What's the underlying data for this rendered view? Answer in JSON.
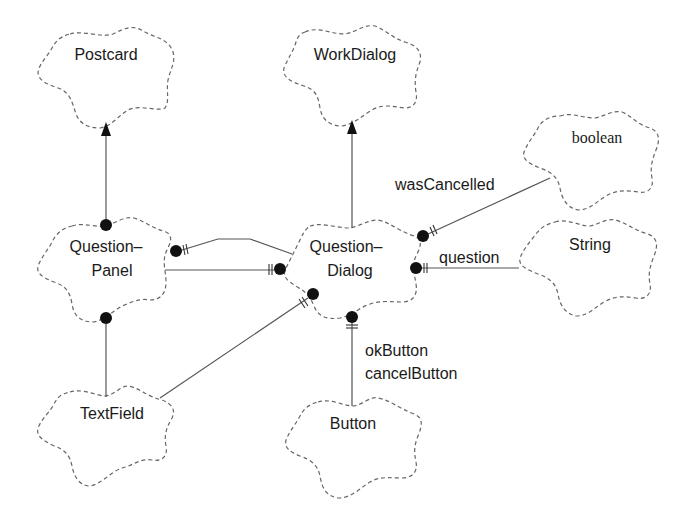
{
  "diagram": {
    "type": "class-diagram",
    "notation": "Booch-style cloud class diagram",
    "classes": [
      {
        "id": "postcard",
        "name": "Postcard",
        "lines": [
          "Postcard"
        ]
      },
      {
        "id": "workdialog",
        "name": "WorkDialog",
        "lines": [
          "WorkDialog"
        ]
      },
      {
        "id": "boolean",
        "name": "boolean",
        "lines": [
          "boolean"
        ]
      },
      {
        "id": "questionpanel",
        "name": "Question-Panel",
        "lines": [
          "Question–",
          "Panel"
        ]
      },
      {
        "id": "questiondialog",
        "name": "Question-Dialog",
        "lines": [
          "Question–",
          "Dialog"
        ]
      },
      {
        "id": "string",
        "name": "String",
        "lines": [
          "String"
        ]
      },
      {
        "id": "textfield",
        "name": "TextField",
        "lines": [
          "TextField"
        ]
      },
      {
        "id": "button",
        "name": "Button",
        "lines": [
          "Button"
        ]
      }
    ],
    "relationships": [
      {
        "from": "questionpanel",
        "to": "postcard",
        "kind": "inheritance"
      },
      {
        "from": "questiondialog",
        "to": "workdialog",
        "kind": "inheritance"
      },
      {
        "from": "questiondialog",
        "to": "boolean",
        "kind": "has",
        "role": "wasCancelled"
      },
      {
        "from": "questiondialog",
        "to": "string",
        "kind": "has",
        "role": "question"
      },
      {
        "from": "questiondialog",
        "to": "button",
        "kind": "has",
        "role": "okButton\ncancelButton"
      },
      {
        "from": "questionpanel",
        "to": "questiondialog",
        "kind": "has"
      },
      {
        "from": "questiondialog",
        "to": "questionpanel",
        "kind": "has"
      },
      {
        "from": "questiondialog",
        "to": "textfield",
        "kind": "has"
      },
      {
        "from": "questionpanel",
        "to": "textfield",
        "kind": "has"
      }
    ],
    "roles": {
      "wasCancelled": "wasCancelled",
      "question": "question",
      "okButton": "okButton",
      "cancelButton": "cancelButton"
    }
  }
}
